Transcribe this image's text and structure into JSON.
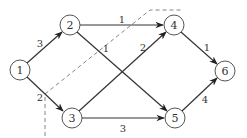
{
  "diagram": {
    "type": "flow-network",
    "nodes": [
      {
        "id": "1",
        "label": "1",
        "x": 20,
        "y": 70
      },
      {
        "id": "2",
        "label": "2",
        "x": 70,
        "y": 25
      },
      {
        "id": "3",
        "label": "3",
        "x": 72,
        "y": 118
      },
      {
        "id": "4",
        "label": "4",
        "x": 174,
        "y": 25
      },
      {
        "id": "5",
        "label": "5",
        "x": 175,
        "y": 118
      },
      {
        "id": "6",
        "label": "6",
        "x": 225,
        "y": 71
      }
    ],
    "edges": [
      {
        "from": "1",
        "to": "2",
        "weight": "3"
      },
      {
        "from": "1",
        "to": "3",
        "weight": "2"
      },
      {
        "from": "2",
        "to": "4",
        "weight": "1"
      },
      {
        "from": "2",
        "to": "5",
        "weight": "1"
      },
      {
        "from": "3",
        "to": "4",
        "weight": "2"
      },
      {
        "from": "3",
        "to": "5",
        "weight": "3"
      },
      {
        "from": "4",
        "to": "6",
        "weight": "1"
      },
      {
        "from": "5",
        "to": "6",
        "weight": "4"
      }
    ],
    "cut_line": {
      "style": "dashed",
      "points": [
        [
          45,
          136
        ],
        [
          45,
          94
        ],
        [
          150,
          10
        ],
        [
          182,
          10
        ]
      ]
    }
  },
  "labels": {
    "n1": "1",
    "n2": "2",
    "n3": "3",
    "n4": "4",
    "n5": "5",
    "n6": "6",
    "e12": "3",
    "e13": "2",
    "e24": "1",
    "e25": "1",
    "e34": "2",
    "e35": "3",
    "e46": "1",
    "e56": "4"
  },
  "colors": {
    "stroke": "#333333",
    "node_border": "#555555",
    "cut": "#777777",
    "background": "#ffffff"
  }
}
